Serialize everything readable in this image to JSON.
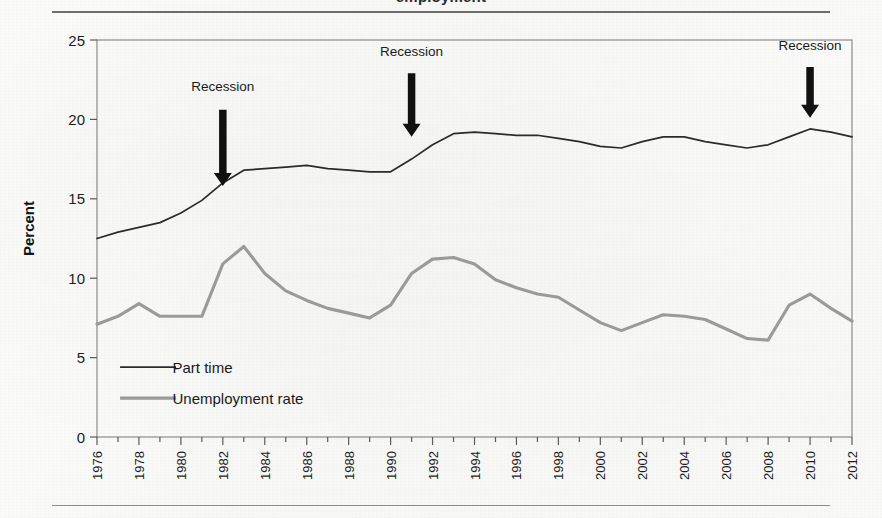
{
  "figure": {
    "caption_clipped": "employment",
    "top_rule": true,
    "bottom_rule": true
  },
  "chart_data": {
    "type": "line",
    "title": "",
    "xlabel": "",
    "ylabel": "Percent",
    "xlim": [
      1976,
      2012
    ],
    "ylim": [
      0,
      25
    ],
    "yticks": [
      0,
      5,
      10,
      15,
      20,
      25
    ],
    "xticks": [
      1976,
      1978,
      1980,
      1982,
      1984,
      1986,
      1988,
      1990,
      1992,
      1994,
      1996,
      1998,
      2000,
      2002,
      2004,
      2006,
      2008,
      2010,
      2012
    ],
    "xminor_step": 1,
    "grid": false,
    "legend_position": "lower left",
    "x": [
      1976,
      1977,
      1978,
      1979,
      1980,
      1981,
      1982,
      1983,
      1984,
      1985,
      1986,
      1987,
      1988,
      1989,
      1990,
      1991,
      1992,
      1993,
      1994,
      1995,
      1996,
      1997,
      1998,
      1999,
      2000,
      2001,
      2002,
      2003,
      2004,
      2005,
      2006,
      2007,
      2008,
      2009,
      2010,
      2011,
      2012
    ],
    "series": [
      {
        "name": "Part time",
        "color": "#2b2b2b",
        "width": 1.7,
        "values": [
          12.5,
          12.9,
          13.2,
          13.5,
          14.1,
          14.9,
          16.0,
          16.8,
          16.9,
          17.0,
          17.1,
          16.9,
          16.8,
          16.7,
          16.7,
          17.5,
          18.4,
          19.1,
          19.2,
          19.1,
          19.0,
          19.0,
          18.8,
          18.6,
          18.3,
          18.2,
          18.6,
          18.9,
          18.9,
          18.6,
          18.4,
          18.2,
          18.4,
          18.9,
          19.4,
          19.2,
          18.9
        ]
      },
      {
        "name": "Unemployment rate",
        "color": "#9a9a9a",
        "width": 3.1,
        "values": [
          7.1,
          7.6,
          8.4,
          7.6,
          7.6,
          7.6,
          10.9,
          12.0,
          10.3,
          9.2,
          8.6,
          8.1,
          7.8,
          7.5,
          8.3,
          10.3,
          11.2,
          11.3,
          10.9,
          9.9,
          9.4,
          9.0,
          8.8,
          8.0,
          7.2,
          6.7,
          7.2,
          7.7,
          7.6,
          7.4,
          6.8,
          6.2,
          6.1,
          8.3,
          9.0,
          8.1,
          7.3
        ]
      }
    ],
    "annotations": [
      {
        "label": "Recession",
        "x": 1982,
        "label_y": 21.8,
        "arrow_top_y": 20.6,
        "arrow_tip_y": 15.8
      },
      {
        "label": "Recession",
        "x": 1991,
        "label_y": 24.0,
        "arrow_top_y": 22.9,
        "arrow_tip_y": 18.9
      },
      {
        "label": "Recession",
        "x": 2010,
        "label_y": 24.4,
        "arrow_top_y": 23.3,
        "arrow_tip_y": 20.1
      }
    ]
  }
}
